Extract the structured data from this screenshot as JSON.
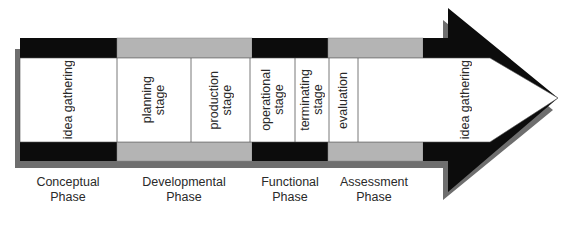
{
  "colors": {
    "band_dark": "#0c0c0c",
    "band_light": "#b4b4b4",
    "shadow": "#6e6e6e",
    "body": "#ffffff",
    "divider": "#555555",
    "text": "#2a2a2a"
  },
  "stages": [
    {
      "label": "idea gathering"
    },
    {
      "label": "planning\nstage"
    },
    {
      "label": "production\nstage"
    },
    {
      "label": "operational\nstage"
    },
    {
      "label": "terminating\nstage"
    },
    {
      "label": "evaluation"
    },
    {
      "label": "idea gathering"
    }
  ],
  "phases": [
    {
      "label": "Conceptual\nPhase"
    },
    {
      "label": "Developmental\nPhase"
    },
    {
      "label": "Functional\nPhase"
    },
    {
      "label": "Assessment\nPhase"
    }
  ]
}
